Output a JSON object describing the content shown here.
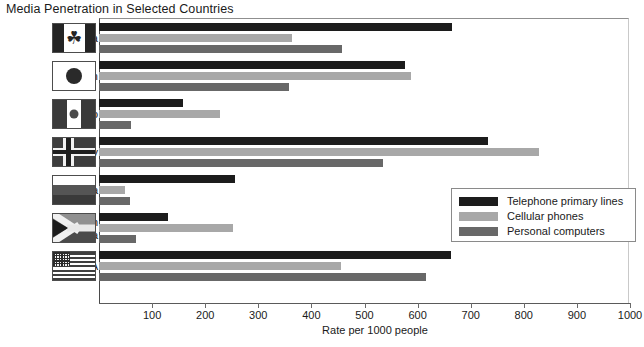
{
  "chart_data": {
    "type": "bar",
    "orientation": "horizontal",
    "title": "Media Penetration in Selected Countries",
    "xlabel": "Rate per 1000 people",
    "ylabel": "",
    "xlim": [
      0,
      1000
    ],
    "xticks": [
      100,
      200,
      300,
      400,
      500,
      600,
      700,
      800,
      900,
      1000
    ],
    "grid": false,
    "legend_position": "center-right",
    "categories": [
      "Canada",
      "Japan",
      "Mexico",
      "Norway",
      "Russia",
      "South Africa",
      "USA"
    ],
    "series": [
      {
        "name": "Telephone primary lines",
        "color": "#1c1c1c",
        "values": [
          664,
          577,
          158,
          732,
          257,
          130,
          662
        ]
      },
      {
        "name": "Cellular phones",
        "color": "#a8a8a8",
        "values": [
          364,
          587,
          228,
          828,
          49,
          253,
          455
        ]
      },
      {
        "name": "Personal computers",
        "color": "#686868",
        "values": [
          458,
          357,
          60,
          534,
          59,
          70,
          615
        ]
      }
    ]
  },
  "axis": {
    "title": "Rate per 1000 people",
    "tick_labels": [
      "100",
      "200",
      "300",
      "400",
      "500",
      "600",
      "700",
      "800",
      "900",
      "1000"
    ]
  },
  "legend": {
    "items": [
      {
        "label": "Telephone primary lines",
        "color": "#1c1c1c"
      },
      {
        "label": "Cellular phones",
        "color": "#a8a8a8"
      },
      {
        "label": "Personal computers",
        "color": "#686868"
      }
    ]
  },
  "flags": {
    "canada": "canada-flag-icon",
    "japan": "japan-flag-icon",
    "mexico": "mexico-flag-icon",
    "norway": "norway-flag-icon",
    "russia": "russia-flag-icon",
    "south_africa": "south-africa-flag-icon",
    "usa": "usa-flag-icon"
  },
  "glyphs": {
    "maple_leaf": "☘"
  }
}
